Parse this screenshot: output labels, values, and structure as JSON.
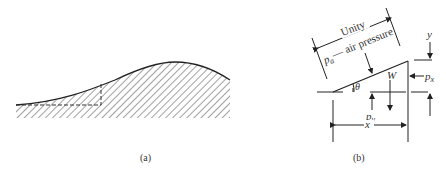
{
  "figure": {
    "panel_a": {
      "caption": "(a)"
    },
    "panel_b": {
      "caption": "(b)",
      "labels": {
        "unity": "Unity",
        "pa": "p",
        "pa_sub": "a",
        "air_pressure": " — air pressure",
        "W": "W",
        "theta": "θ",
        "px": "p",
        "px_sub": "x",
        "py": "p",
        "py_sub": "y",
        "x": "x",
        "y": "y"
      }
    }
  }
}
